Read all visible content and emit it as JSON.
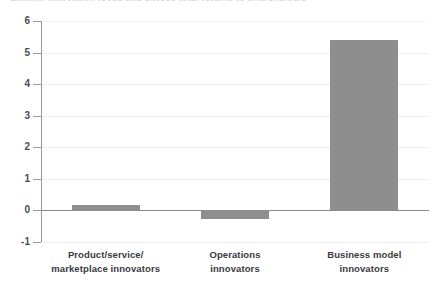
{
  "title_remnant": "Exhibit: Innovation focus and excess total returns to shareholders",
  "chart_data": {
    "type": "bar",
    "title": "",
    "subtitle": "",
    "xlabel": "",
    "ylabel": "",
    "categories": [
      "Product/service/ marketplace innovators",
      "Operations innovators",
      "Business model innovators"
    ],
    "category_lines": [
      [
        "Product/service/",
        "marketplace innovators"
      ],
      [
        "Operations",
        "innovators"
      ],
      [
        "Business model",
        "innovators"
      ]
    ],
    "values": [
      0.17,
      -0.3,
      5.4
    ],
    "value_labels": [
      "0.17",
      "-0.3",
      "5.4"
    ],
    "ylim": [
      -1,
      6
    ],
    "ytick_labels": [
      "6",
      "5",
      "4",
      "3",
      "2",
      "1",
      "0",
      "-1"
    ],
    "ytick_values": [
      6,
      5,
      4,
      3,
      2,
      1,
      0,
      -1
    ],
    "grid": true,
    "legend": "none",
    "bar_color": "#8e8e8e",
    "axis_color": "#9a9a9a",
    "grid_color": "#f0f0f0",
    "zero_line_color": "#8a8a8a",
    "label_color": "#3a3a3e"
  }
}
